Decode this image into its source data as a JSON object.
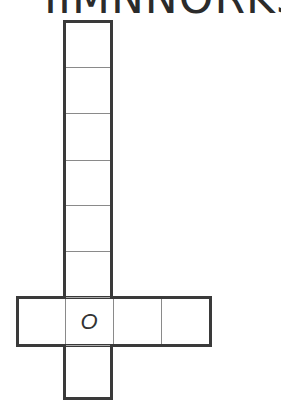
{
  "header": {
    "title": "IIMNNORKS"
  },
  "puzzle": {
    "type": "crossword-grid",
    "vertical": {
      "cells": 8,
      "filled": [
        "",
        "",
        "",
        "",
        "",
        "",
        "O",
        ""
      ]
    },
    "horizontal": {
      "cells": 4,
      "filled": [
        "",
        "O",
        "",
        ""
      ]
    },
    "intersection_letter": "O"
  },
  "colors": {
    "border": "#3a3a3a",
    "divider": "#8a8a8a",
    "text": "#2b2b2b"
  }
}
